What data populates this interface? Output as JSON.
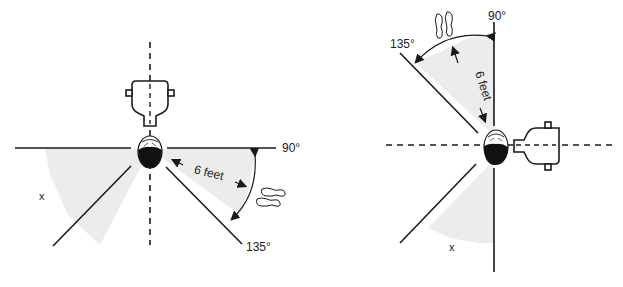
{
  "left_figure": {
    "angle_90_label": "90°",
    "angle_135_label": "135°",
    "distance_label": "6 feet",
    "zone_label": "x"
  },
  "right_figure": {
    "angle_90_label": "90°",
    "angle_135_label": "135°",
    "distance_label": "6 feet",
    "zone_label": "x"
  },
  "colors": {
    "line": "#1a1a1a",
    "shade": "#ececec",
    "background": "#ffffff"
  }
}
